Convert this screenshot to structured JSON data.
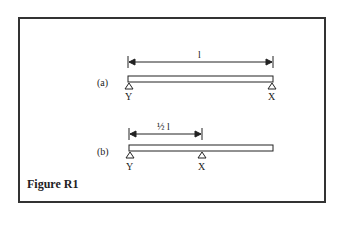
{
  "figure": {
    "caption": "Figure R1",
    "colors": {
      "line": "#222222",
      "border": "#333333",
      "background": "#ffffff"
    },
    "diagrams": [
      {
        "label": "(a)",
        "dimension_label": "l",
        "supports": [
          {
            "name": "Y",
            "position": "left-end"
          },
          {
            "name": "X",
            "position": "right-end"
          }
        ]
      },
      {
        "label": "(b)",
        "dimension_label": "½ l",
        "supports": [
          {
            "name": "Y",
            "position": "left-end"
          },
          {
            "name": "X",
            "position": "mid-span"
          }
        ]
      }
    ]
  }
}
